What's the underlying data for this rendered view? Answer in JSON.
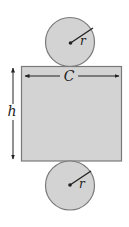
{
  "diagram": {
    "labels": {
      "radius_top": "r",
      "radius_bottom": "r",
      "circumference": "C",
      "height": "h"
    },
    "colors": {
      "fill": "#d3d3d3",
      "stroke": "#7a7a7a",
      "line": "#222222"
    }
  }
}
